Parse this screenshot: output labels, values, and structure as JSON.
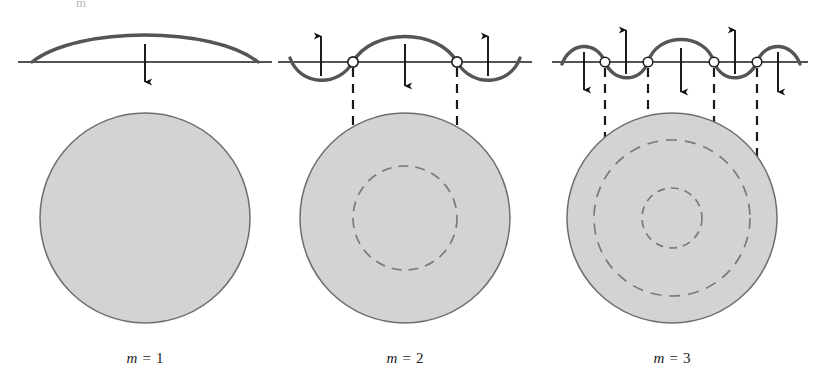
{
  "figure": {
    "type": "physics-diagram",
    "top_clipped_text": "m",
    "colors": {
      "disk_fill": "#d3d3d3",
      "disk_stroke": "#6e6e6e",
      "wave_curve": "#555555",
      "baseline": "#1a1a1a",
      "arrow": "#111111",
      "node_marker_fill": "#ffffff",
      "node_marker_stroke": "#222222",
      "dashed_projection": "#1a1a1a",
      "dashed_nodal_circle": "#7a7a7a",
      "label_text": "#1a1a1a",
      "background": "#ffffff"
    },
    "panels": [
      {
        "id": "panel-m1",
        "label": "m = 1",
        "label_var": "m",
        "label_eq": "=",
        "label_value": "1",
        "mode_number": 1,
        "center_x": 145,
        "baseline_y": 62,
        "disk": {
          "cx": 145,
          "cy": 218,
          "radius": 105,
          "nodal_circle_radii": [],
          "nodal_circle_count": 0
        },
        "wave": {
          "lobes": [
            {
              "direction": "up",
              "x_start": 32,
              "x_end": 258,
              "peak_x": 145
            }
          ],
          "node_x_positions": [],
          "arrows": [
            {
              "x": 145,
              "direction": "down",
              "label": "down-arrow"
            }
          ]
        },
        "projection_lines": []
      },
      {
        "id": "panel-m2",
        "label": "m = 2",
        "label_var": "m",
        "label_eq": "=",
        "label_value": "2",
        "mode_number": 2,
        "center_x": 405,
        "baseline_y": 62,
        "disk": {
          "cx": 405,
          "cy": 218,
          "radius": 105,
          "nodal_circle_radii": [
            52
          ],
          "nodal_circle_count": 1
        },
        "wave": {
          "lobes": [
            {
              "direction": "down",
              "x_start": 290,
              "x_end": 353,
              "peak_x": 321
            },
            {
              "direction": "up",
              "x_start": 353,
              "x_end": 457,
              "peak_x": 405
            },
            {
              "direction": "down",
              "x_start": 457,
              "x_end": 520,
              "peak_x": 488
            }
          ],
          "node_x_positions": [
            353,
            457
          ],
          "arrows": [
            {
              "x": 321,
              "direction": "up",
              "label": "up-arrow"
            },
            {
              "x": 405,
              "direction": "down",
              "label": "down-arrow"
            },
            {
              "x": 488,
              "direction": "up",
              "label": "up-arrow"
            }
          ]
        },
        "projection_lines": [
          {
            "x": 353,
            "y_start": 66,
            "y_end": 198
          },
          {
            "x": 457,
            "y_start": 66,
            "y_end": 198
          }
        ]
      },
      {
        "id": "panel-m3",
        "label": "m = 3",
        "label_var": "m",
        "label_eq": "=",
        "label_value": "3",
        "mode_number": 3,
        "center_x": 672,
        "baseline_y": 62,
        "disk": {
          "cx": 672,
          "cy": 218,
          "radius": 105,
          "nodal_circle_radii": [
            78,
            30
          ],
          "nodal_circle_count": 2
        },
        "wave": {
          "lobes": [
            {
              "direction": "up",
              "x_start": 562,
              "x_end": 605,
              "peak_x": 584
            },
            {
              "direction": "down",
              "x_start": 605,
              "x_end": 648,
              "peak_x": 626
            },
            {
              "direction": "up",
              "x_start": 648,
              "x_end": 714,
              "peak_x": 681
            },
            {
              "direction": "down",
              "x_start": 714,
              "x_end": 757,
              "peak_x": 735
            },
            {
              "direction": "up",
              "x_start": 757,
              "x_end": 800,
              "peak_x": 778
            }
          ],
          "node_x_positions": [
            605,
            648,
            714,
            757
          ],
          "arrows": [
            {
              "x": 584,
              "direction": "down",
              "label": "down-arrow"
            },
            {
              "x": 626,
              "direction": "up",
              "label": "up-arrow"
            },
            {
              "x": 681,
              "direction": "down",
              "label": "down-arrow"
            },
            {
              "x": 735,
              "direction": "up",
              "label": "up-arrow"
            },
            {
              "x": 778,
              "direction": "down",
              "label": "down-arrow"
            }
          ]
        },
        "projection_lines": [
          {
            "x": 605,
            "y_start": 66,
            "y_end": 225
          },
          {
            "x": 648,
            "y_start": 66,
            "y_end": 225
          },
          {
            "x": 714,
            "y_start": 66,
            "y_end": 225
          },
          {
            "x": 757,
            "y_start": 66,
            "y_end": 225
          }
        ]
      }
    ]
  }
}
